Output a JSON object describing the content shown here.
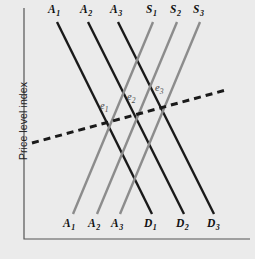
{
  "chart_data": {
    "type": "line",
    "title": "",
    "xlabel": "",
    "ylabel": "Price level index",
    "grid": false,
    "legend": "none",
    "background_color": "#ebebeb",
    "axis_color": "#555555",
    "series": [
      {
        "name": "A1",
        "role": "aggregate-demand",
        "direction": "downward-sloping",
        "color": "#1a1a1a",
        "style": "solid",
        "top_label": "A1",
        "bottom_label": "D1",
        "x1": 57,
        "y1": 22,
        "x2": 152,
        "y2": 214
      },
      {
        "name": "A2",
        "role": "aggregate-demand",
        "direction": "downward-sloping",
        "color": "#1a1a1a",
        "style": "solid",
        "top_label": "A2",
        "bottom_label": "D2",
        "x1": 88,
        "y1": 22,
        "x2": 184,
        "y2": 214
      },
      {
        "name": "A3",
        "role": "aggregate-demand",
        "direction": "downward-sloping",
        "color": "#1a1a1a",
        "style": "solid",
        "top_label": "A3",
        "bottom_label": "D3",
        "x1": 118,
        "y1": 22,
        "x2": 214,
        "y2": 214
      },
      {
        "name": "S1",
        "role": "aggregate-supply",
        "direction": "upward-sloping",
        "color": "#8c8c8c",
        "style": "solid",
        "top_label": "S1",
        "bottom_label": "A1",
        "x1": 153,
        "y1": 22,
        "x2": 73,
        "y2": 214
      },
      {
        "name": "S2",
        "role": "aggregate-supply",
        "direction": "upward-sloping",
        "color": "#8c8c8c",
        "style": "solid",
        "top_label": "S2",
        "bottom_label": "A2",
        "x1": 177,
        "y1": 22,
        "x2": 97,
        "y2": 214
      },
      {
        "name": "S3",
        "role": "aggregate-supply",
        "direction": "upward-sloping",
        "color": "#8c8c8c",
        "style": "solid",
        "top_label": "S3",
        "bottom_label": "A3",
        "x1": 200,
        "y1": 22,
        "x2": 120,
        "y2": 214
      },
      {
        "name": "long-run-path",
        "role": "equilibrium-path",
        "direction": "upward-sloping",
        "color": "#1a1a1a",
        "style": "dashed",
        "x1": 32,
        "y1": 143,
        "x2": 226,
        "y2": 90
      }
    ],
    "equilibria": [
      {
        "name": "e1",
        "x": 107,
        "y": 124,
        "label_x": 100,
        "label_y": 101
      },
      {
        "name": "e2",
        "x": 135,
        "y": 115,
        "label_x": 127,
        "label_y": 92
      },
      {
        "name": "e3",
        "x": 162,
        "y": 106,
        "label_x": 155,
        "label_y": 83
      }
    ]
  },
  "axes": {
    "y_label": "Price level index",
    "x_label": "",
    "origin_x": 24,
    "origin_y": 239,
    "x_end": 250,
    "y_top": 8
  },
  "labels": {
    "top": [
      {
        "id": "A1",
        "base": "A",
        "sub": "1",
        "x": 48,
        "y": 4
      },
      {
        "id": "A2",
        "base": "A",
        "sub": "2",
        "x": 80,
        "y": 4
      },
      {
        "id": "A3",
        "base": "A",
        "sub": "3",
        "x": 110,
        "y": 4
      },
      {
        "id": "S1",
        "base": "S",
        "sub": "1",
        "x": 146,
        "y": 4
      },
      {
        "id": "S2",
        "base": "S",
        "sub": "2",
        "x": 170,
        "y": 4
      },
      {
        "id": "S3",
        "base": "S",
        "sub": "3",
        "x": 193,
        "y": 4
      }
    ],
    "bottom": [
      {
        "id": "A1b",
        "base": "A",
        "sub": "1",
        "x": 63,
        "y": 218
      },
      {
        "id": "A2b",
        "base": "A",
        "sub": "2",
        "x": 88,
        "y": 218
      },
      {
        "id": "A3b",
        "base": "A",
        "sub": "3",
        "x": 111,
        "y": 218
      },
      {
        "id": "D1",
        "base": "D",
        "sub": "1",
        "x": 144,
        "y": 218
      },
      {
        "id": "D2",
        "base": "D",
        "sub": "2",
        "x": 176,
        "y": 218
      },
      {
        "id": "D3",
        "base": "D",
        "sub": "3",
        "x": 207,
        "y": 218
      }
    ],
    "equilibrium": [
      {
        "id": "e1",
        "base": "e",
        "sub": "1",
        "x": 100,
        "y": 101
      },
      {
        "id": "e2",
        "base": "e",
        "sub": "2",
        "x": 127,
        "y": 92
      },
      {
        "id": "e3",
        "base": "e",
        "sub": "3",
        "x": 155,
        "y": 83
      }
    ]
  }
}
